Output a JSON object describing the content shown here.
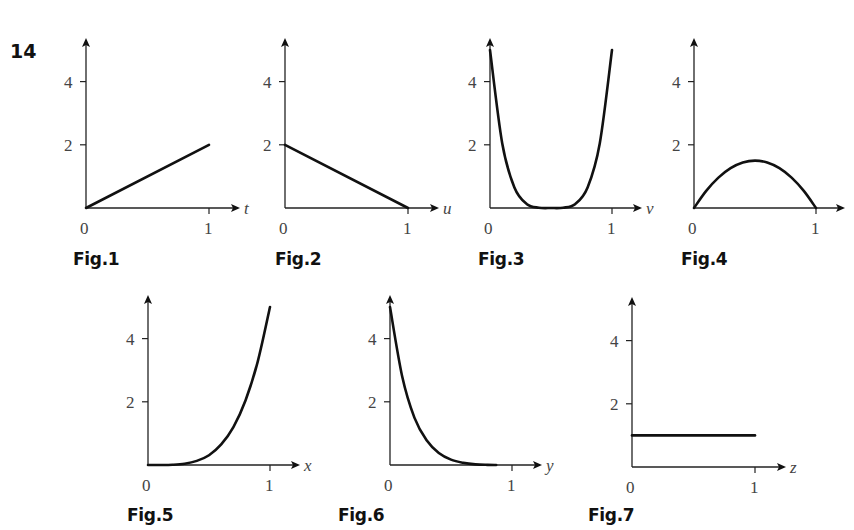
{
  "question_number": "14",
  "figures": [
    {
      "id": "fig1",
      "label": "Fig.1",
      "axis_var": "t"
    },
    {
      "id": "fig2",
      "label": "Fig.2",
      "axis_var": "u"
    },
    {
      "id": "fig3",
      "label": "Fig.3",
      "axis_var": "v"
    },
    {
      "id": "fig4",
      "label": "Fig.4",
      "axis_var": ""
    },
    {
      "id": "fig5",
      "label": "Fig.5",
      "axis_var": "x"
    },
    {
      "id": "fig6",
      "label": "Fig.6",
      "axis_var": "y"
    },
    {
      "id": "fig7",
      "label": "Fig.7",
      "axis_var": "z"
    }
  ],
  "tick_labels": {
    "y_ticks": [
      "2",
      "4"
    ],
    "x_origin": "0",
    "x_one": "1"
  },
  "colors": {
    "curve": "#111111",
    "axis": "#222222",
    "text": "#444444"
  },
  "chart_data": [
    {
      "type": "line",
      "title": "Fig.1",
      "xlabel": "t",
      "ylabel": "",
      "xlim": [
        0,
        1
      ],
      "ylim": [
        0,
        5
      ],
      "yticks": [
        2,
        4
      ],
      "xticks": [
        0,
        1
      ],
      "x": [
        0,
        1
      ],
      "values": [
        0,
        2
      ]
    },
    {
      "type": "line",
      "title": "Fig.2",
      "xlabel": "u",
      "ylabel": "",
      "xlim": [
        0,
        1
      ],
      "ylim": [
        0,
        5
      ],
      "yticks": [
        2,
        4
      ],
      "xticks": [
        0,
        1
      ],
      "x": [
        0,
        1
      ],
      "values": [
        2,
        0
      ]
    },
    {
      "type": "line",
      "title": "Fig.3",
      "xlabel": "v",
      "ylabel": "",
      "xlim": [
        0,
        1
      ],
      "ylim": [
        0,
        5
      ],
      "yticks": [
        2,
        4
      ],
      "xticks": [
        0,
        1
      ],
      "x": [
        0.0,
        0.1,
        0.2,
        0.3,
        0.4,
        0.5,
        0.6,
        0.7,
        0.8,
        0.9,
        1.0
      ],
      "values": [
        5.0,
        2.05,
        0.65,
        0.13,
        0.01,
        0.0,
        0.01,
        0.13,
        0.65,
        2.05,
        5.0
      ]
    },
    {
      "type": "line",
      "title": "Fig.4",
      "xlabel": "",
      "ylabel": "",
      "xlim": [
        0,
        1
      ],
      "ylim": [
        0,
        5
      ],
      "yticks": [
        2,
        4
      ],
      "xticks": [
        0,
        1
      ],
      "x": [
        0.0,
        0.1,
        0.2,
        0.3,
        0.4,
        0.5,
        0.6,
        0.7,
        0.8,
        0.9,
        1.0
      ],
      "values": [
        0.0,
        0.54,
        0.96,
        1.26,
        1.44,
        1.5,
        1.44,
        1.26,
        0.96,
        0.54,
        0.0
      ]
    },
    {
      "type": "line",
      "title": "Fig.5",
      "xlabel": "x",
      "ylabel": "",
      "xlim": [
        0,
        1
      ],
      "ylim": [
        0,
        5
      ],
      "yticks": [
        2,
        4
      ],
      "xticks": [
        0,
        1
      ],
      "x": [
        0.0,
        0.1,
        0.2,
        0.3,
        0.4,
        0.5,
        0.6,
        0.7,
        0.8,
        0.9,
        1.0
      ],
      "values": [
        0.0,
        0.0005,
        0.008,
        0.04,
        0.13,
        0.31,
        0.65,
        1.2,
        2.05,
        3.28,
        5.0
      ]
    },
    {
      "type": "line",
      "title": "Fig.6",
      "xlabel": "y",
      "ylabel": "",
      "xlim": [
        0,
        1
      ],
      "ylim": [
        0,
        5
      ],
      "yticks": [
        2,
        4
      ],
      "xticks": [
        0,
        1
      ],
      "x": [
        0.0,
        0.1,
        0.2,
        0.3,
        0.4,
        0.5,
        0.6,
        0.7,
        0.8,
        0.87
      ],
      "values": [
        5.0,
        2.8,
        1.5,
        0.78,
        0.38,
        0.17,
        0.07,
        0.02,
        0.004,
        0.0
      ]
    },
    {
      "type": "line",
      "title": "Fig.7",
      "xlabel": "z",
      "ylabel": "",
      "xlim": [
        0,
        1
      ],
      "ylim": [
        0,
        5
      ],
      "yticks": [
        2,
        4
      ],
      "xticks": [
        0,
        1
      ],
      "x": [
        0,
        1
      ],
      "values": [
        1,
        1
      ]
    }
  ]
}
